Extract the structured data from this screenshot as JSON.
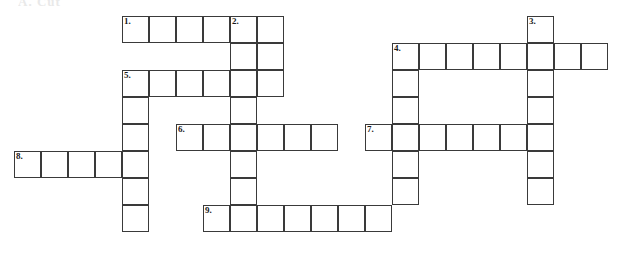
{
  "page": {
    "cut_off_text": "A. Cut"
  },
  "grid": {
    "cell_size": 27,
    "origin_x": 14,
    "origin_y": 16,
    "columns": 23,
    "rows": 9,
    "border_color": "#3a3a3a",
    "cell_fill": "#ffffff"
  },
  "clues": [
    {
      "number": "1.",
      "direction": "across",
      "row": 0,
      "col": 4,
      "length": 6
    },
    {
      "number": "2.",
      "direction": "down",
      "row": 0,
      "col": 8,
      "length": 8
    },
    {
      "number": "3.",
      "direction": "down",
      "row": 0,
      "col": 19,
      "length": 6
    },
    {
      "number": "4.",
      "direction": "across",
      "row": 1,
      "col": 14,
      "length": 8
    },
    {
      "number": "4.",
      "direction": "down",
      "row": 1,
      "col": 14,
      "length": 6
    },
    {
      "number": "5.",
      "direction": "across",
      "row": 2,
      "col": 4,
      "length": 6
    },
    {
      "number": "5.",
      "direction": "down",
      "row": 2,
      "col": 4,
      "length": 6
    },
    {
      "number": "6.",
      "direction": "across",
      "row": 4,
      "col": 6,
      "length": 6
    },
    {
      "number": "7.",
      "direction": "across",
      "row": 4,
      "col": 13,
      "length": 7
    },
    {
      "number": "8.",
      "direction": "across",
      "row": 5,
      "col": 0,
      "length": 5
    },
    {
      "number": "9.",
      "direction": "across",
      "row": 7,
      "col": 7,
      "length": 7
    }
  ],
  "cells": [
    {
      "r": 0,
      "c": 4,
      "num": "1."
    },
    {
      "r": 0,
      "c": 5,
      "num": ""
    },
    {
      "r": 0,
      "c": 6,
      "num": ""
    },
    {
      "r": 0,
      "c": 7,
      "num": ""
    },
    {
      "r": 0,
      "c": 8,
      "num": "2."
    },
    {
      "r": 0,
      "c": 9,
      "num": ""
    },
    {
      "r": 0,
      "c": 19,
      "num": "3."
    },
    {
      "r": 1,
      "c": 8,
      "num": ""
    },
    {
      "r": 1,
      "c": 9,
      "num": ""
    },
    {
      "r": 1,
      "c": 14,
      "num": "4."
    },
    {
      "r": 1,
      "c": 15,
      "num": ""
    },
    {
      "r": 1,
      "c": 16,
      "num": ""
    },
    {
      "r": 1,
      "c": 17,
      "num": ""
    },
    {
      "r": 1,
      "c": 18,
      "num": ""
    },
    {
      "r": 1,
      "c": 19,
      "num": ""
    },
    {
      "r": 1,
      "c": 20,
      "num": ""
    },
    {
      "r": 1,
      "c": 21,
      "num": ""
    },
    {
      "r": 2,
      "c": 4,
      "num": "5."
    },
    {
      "r": 2,
      "c": 5,
      "num": ""
    },
    {
      "r": 2,
      "c": 6,
      "num": ""
    },
    {
      "r": 2,
      "c": 7,
      "num": ""
    },
    {
      "r": 2,
      "c": 8,
      "num": ""
    },
    {
      "r": 2,
      "c": 9,
      "num": ""
    },
    {
      "r": 2,
      "c": 14,
      "num": ""
    },
    {
      "r": 2,
      "c": 19,
      "num": ""
    },
    {
      "r": 3,
      "c": 4,
      "num": ""
    },
    {
      "r": 3,
      "c": 8,
      "num": ""
    },
    {
      "r": 3,
      "c": 14,
      "num": ""
    },
    {
      "r": 3,
      "c": 19,
      "num": ""
    },
    {
      "r": 4,
      "c": 4,
      "num": ""
    },
    {
      "r": 4,
      "c": 6,
      "num": "6."
    },
    {
      "r": 4,
      "c": 7,
      "num": ""
    },
    {
      "r": 4,
      "c": 8,
      "num": ""
    },
    {
      "r": 4,
      "c": 9,
      "num": ""
    },
    {
      "r": 4,
      "c": 10,
      "num": ""
    },
    {
      "r": 4,
      "c": 11,
      "num": ""
    },
    {
      "r": 4,
      "c": 13,
      "num": "7."
    },
    {
      "r": 4,
      "c": 14,
      "num": ""
    },
    {
      "r": 4,
      "c": 15,
      "num": ""
    },
    {
      "r": 4,
      "c": 16,
      "num": ""
    },
    {
      "r": 4,
      "c": 17,
      "num": ""
    },
    {
      "r": 4,
      "c": 18,
      "num": ""
    },
    {
      "r": 4,
      "c": 19,
      "num": ""
    },
    {
      "r": 5,
      "c": 0,
      "num": "8."
    },
    {
      "r": 5,
      "c": 1,
      "num": ""
    },
    {
      "r": 5,
      "c": 2,
      "num": ""
    },
    {
      "r": 5,
      "c": 3,
      "num": ""
    },
    {
      "r": 5,
      "c": 4,
      "num": ""
    },
    {
      "r": 5,
      "c": 8,
      "num": ""
    },
    {
      "r": 5,
      "c": 14,
      "num": ""
    },
    {
      "r": 5,
      "c": 19,
      "num": ""
    },
    {
      "r": 6,
      "c": 4,
      "num": ""
    },
    {
      "r": 6,
      "c": 8,
      "num": ""
    },
    {
      "r": 6,
      "c": 14,
      "num": ""
    },
    {
      "r": 6,
      "c": 19,
      "num": ""
    },
    {
      "r": 7,
      "c": 4,
      "num": ""
    },
    {
      "r": 7,
      "c": 7,
      "num": "9."
    },
    {
      "r": 7,
      "c": 8,
      "num": ""
    },
    {
      "r": 7,
      "c": 9,
      "num": ""
    },
    {
      "r": 7,
      "c": 10,
      "num": ""
    },
    {
      "r": 7,
      "c": 11,
      "num": ""
    },
    {
      "r": 7,
      "c": 12,
      "num": ""
    },
    {
      "r": 7,
      "c": 13,
      "num": ""
    }
  ]
}
